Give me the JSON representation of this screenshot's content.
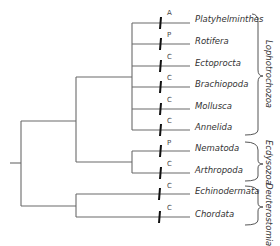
{
  "taxa": [
    {
      "name": "Platyhelminthes",
      "character": "A"
    },
    {
      "name": "Rotifera",
      "character": "P"
    },
    {
      "name": "Ectoprocta",
      "character": "C"
    },
    {
      "name": "Brachiopoda",
      "character": "C"
    },
    {
      "name": "Mollusca",
      "character": "C"
    },
    {
      "name": "Annelida",
      "character": "C"
    },
    {
      "name": "Nematoda",
      "character": "P"
    },
    {
      "name": "Arthropoda",
      "character": "C"
    },
    {
      "name": "Echinodermata",
      "character": "C"
    },
    {
      "name": "Chordata",
      "character": "C"
    }
  ],
  "clades": {
    "lophotrochozoa": "Lophotrochozoa",
    "ecdysozoa": "Ecdysozoa",
    "deuterostomia": "Deuterostomia"
  },
  "colors": {
    "line": "#6a6a6a",
    "tick": "#111111",
    "text": "#333333"
  }
}
